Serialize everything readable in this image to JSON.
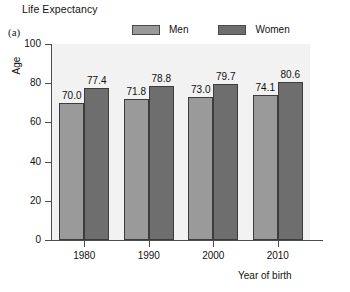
{
  "title": "Life Expectancy",
  "panel_label": "(a)",
  "legend": {
    "items": [
      {
        "label": "Men",
        "color": "#9a9a9a"
      },
      {
        "label": "Women",
        "color": "#6e6e6e"
      }
    ]
  },
  "axes": {
    "y_title": "Age",
    "x_title": "Year of birth",
    "y_ticks": [
      "0",
      "20",
      "40",
      "60",
      "80",
      "100"
    ],
    "x_ticks": [
      "1980",
      "1990",
      "2000",
      "2010"
    ]
  },
  "chart_data": {
    "type": "bar",
    "title": "Life Expectancy",
    "xlabel": "Year of birth",
    "ylabel": "Age",
    "categories": [
      "1980",
      "1990",
      "2000",
      "2010"
    ],
    "series": [
      {
        "name": "Men",
        "color": "#9a9a9a",
        "values": [
          70.0,
          71.8,
          73.0,
          74.1
        ],
        "labels": [
          "70.0",
          "71.8",
          "73.0",
          "74.1"
        ]
      },
      {
        "name": "Women",
        "color": "#6e6e6e",
        "values": [
          77.4,
          78.8,
          79.7,
          80.6
        ],
        "labels": [
          "77.4",
          "78.8",
          "79.7",
          "80.6"
        ]
      }
    ],
    "ylim": [
      0,
      100
    ],
    "ytick_step": 20,
    "grid": false,
    "legend_position": "top"
  }
}
